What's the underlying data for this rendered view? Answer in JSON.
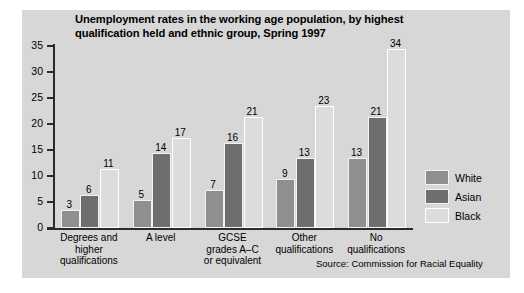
{
  "chart_data": {
    "type": "bar",
    "title": "Unemployment rates in the working age population, by highest qualification held and ethnic group, Spring 1997",
    "title_line1": "Unemployment rates in the working age population, by highest",
    "title_line2": "qualification held and ethnic group, Spring 1997",
    "xlabel": "",
    "ylabel": "",
    "ylim": [
      0,
      35
    ],
    "yticks": [
      0,
      5,
      10,
      15,
      20,
      25,
      30,
      35
    ],
    "grid": false,
    "legend_position": "right",
    "categories": [
      "Degrees and higher qualifications",
      "A level",
      "GCSE grades A–C or equivalent",
      "Other qualifications",
      "No qualifications"
    ],
    "category_lines": [
      [
        "Degrees and",
        "higher",
        "qualifications"
      ],
      [
        "A level"
      ],
      [
        "GCSE",
        "grades A–C",
        "or equivalent"
      ],
      [
        "Other",
        "qualifications"
      ],
      [
        "No",
        "qualifications"
      ]
    ],
    "series": [
      {
        "name": "White",
        "color": "#8f8f8f",
        "values": [
          3,
          5,
          7,
          9,
          13
        ]
      },
      {
        "name": "Asian",
        "color": "#6e6e6e",
        "values": [
          6,
          14,
          16,
          13,
          21
        ]
      },
      {
        "name": "Black",
        "color": "#dcdcdc",
        "values": [
          11,
          17,
          21,
          23,
          34
        ]
      }
    ],
    "source": "Source: Commission for Racial Equality"
  },
  "legend": {
    "items": [
      {
        "label": "White"
      },
      {
        "label": "Asian"
      },
      {
        "label": "Black"
      }
    ]
  }
}
